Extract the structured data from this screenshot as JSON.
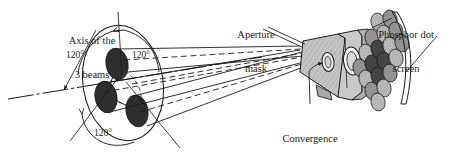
{
  "figure": {
    "type": "technical-diagram",
    "background_color": "#ffffff",
    "ink_color": "#1a1a1a"
  },
  "labels": {
    "axis": {
      "line1": "Axis of the",
      "line2": "3 beams",
      "x": 76,
      "y": 14
    },
    "aperture": {
      "line1": "Aperture",
      "line2": "mask",
      "x": 236,
      "y": 8
    },
    "phosphor": {
      "line1": "Phosphor dot",
      "line2": "screen",
      "x": 369,
      "y": 8
    },
    "convergence": {
      "line1": "Convergence",
      "line2": "point",
      "x": 277,
      "y": 110
    }
  },
  "angles": [
    {
      "text": "120°",
      "x": 76,
      "y": 55
    },
    {
      "text": "120°",
      "x": 132,
      "y": 55
    },
    {
      "text": "120°",
      "x": 93,
      "y": 133
    }
  ],
  "colors": {
    "gun_fill": "#2e2e2e",
    "mask_fill": "#b9b9b9",
    "mask_fill_light": "#d2d2d2",
    "dot_light": "#cfcfcf",
    "dot_mid": "#9a9a9a",
    "dot_dark": "#4a4a4a",
    "stroke": "#1a1a1a"
  },
  "elements": {
    "electron_guns_count": 3,
    "gun_ring": "large tilted ellipse enclosing the three beam sources",
    "beam_lines": "solid and dashed converging rays",
    "aperture_mask": "gray wedge with elliptical apertures",
    "phosphor_dots": "rhombic cluster of stippled circular dots",
    "screen_outline": "curved double line at right"
  }
}
